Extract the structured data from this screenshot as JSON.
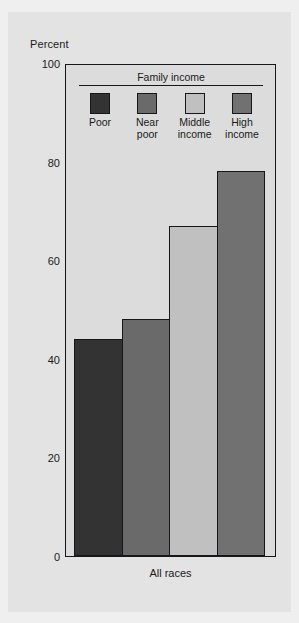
{
  "figure": {
    "axis_title": "Percent",
    "category_label": "All races",
    "legend_title": "Family income"
  },
  "chart_data": {
    "type": "bar",
    "title": "",
    "subtitle": "",
    "xlabel": "",
    "ylabel": "Percent",
    "categories": [
      "All races"
    ],
    "group_labels": [
      "Poor",
      "Near\npoor",
      "Middle\nincome",
      "High\nincome"
    ],
    "series": [
      {
        "name": "Poor",
        "values": [
          44
        ],
        "color": "#333333"
      },
      {
        "name": "Near poor",
        "values": [
          48
        ],
        "color": "#6a6a6a"
      },
      {
        "name": "Middle income",
        "values": [
          67
        ],
        "color": "#c0c0c0"
      },
      {
        "name": "High income",
        "values": [
          78
        ],
        "color": "#717171"
      }
    ],
    "ylim": [
      0,
      100
    ],
    "yticks": [
      0,
      20,
      40,
      60,
      80,
      100
    ],
    "ytick_labels": [
      "0",
      "20",
      "40",
      "60",
      "80",
      "100"
    ],
    "grid": false,
    "legend_position": "inside-top-center"
  },
  "colors": {
    "page_background": "#efefef",
    "card_background": "#e3e3e3",
    "plot_background": "#dcdcdc",
    "frame": "#15171a",
    "text": "#1a1a1a"
  }
}
